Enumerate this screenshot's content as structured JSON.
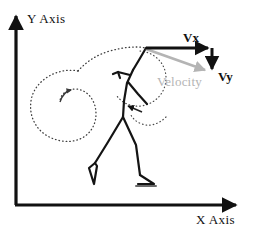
{
  "figure": {
    "type": "physics-vector-diagram",
    "title_text": "",
    "background_color": "#ffffff",
    "width": 254,
    "height": 232
  },
  "axes": {
    "x_label": "X Axis",
    "y_label": "Y Axis",
    "color": "#111111",
    "origin": {
      "x": 16,
      "y": 205
    },
    "x_end": {
      "x": 238,
      "y": 205
    },
    "y_end": {
      "x": 16,
      "y": 14
    }
  },
  "vectors": [
    {
      "name": "vx",
      "label": "Vx",
      "color": "#111111",
      "start": {
        "x": 146,
        "y": 48
      },
      "end": {
        "x": 212,
        "y": 48
      },
      "label_pos": {
        "x": 191,
        "y": 42
      },
      "description": "horizontal velocity component"
    },
    {
      "name": "vy",
      "label": "Vy",
      "color": "#111111",
      "start": {
        "x": 212,
        "y": 48
      },
      "end": {
        "x": 212,
        "y": 73
      },
      "label_pos": {
        "x": 218,
        "y": 79
      },
      "description": "vertical velocity component"
    },
    {
      "name": "velocity",
      "label": "Velocity",
      "color": "#b4b4b4",
      "start": {
        "x": 146,
        "y": 49
      },
      "end": {
        "x": 209,
        "y": 71
      },
      "label_pos": {
        "x": 157,
        "y": 85
      },
      "description": "resultant velocity vector"
    }
  ],
  "annotations": {
    "dotted_trajectory": {
      "name": "swing-trajectory",
      "color": "#4a4a4a",
      "style": "dotted"
    },
    "dotted_spiral": {
      "name": "spiral-loop",
      "color": "#4a4a4a",
      "style": "dotted"
    },
    "dotted_arm_arc": {
      "name": "arm-swing-arc",
      "color": "#4a4a4a",
      "style": "dotted"
    }
  },
  "figure_subject": {
    "name": "stick-figure-walking-person",
    "color": "#111111"
  }
}
